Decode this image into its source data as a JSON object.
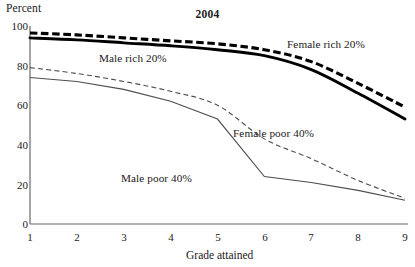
{
  "chart_data": {
    "type": "line",
    "title": "2004",
    "xlabel": "Grade attained",
    "ylabel": "Percent",
    "x": [
      1,
      2,
      3,
      4,
      5,
      6,
      7,
      8,
      9
    ],
    "xtick_labels": [
      "1",
      "2",
      "3",
      "4",
      "5",
      "6",
      "7",
      "8",
      "9"
    ],
    "ytick_labels": [
      "0",
      "20",
      "40",
      "60",
      "80",
      "100"
    ],
    "ytick_values": [
      0,
      20,
      40,
      60,
      80,
      100
    ],
    "ylim": [
      0,
      100
    ],
    "xlim": [
      1,
      9
    ],
    "grid": false,
    "legend_position": "inline-annotations",
    "series": [
      {
        "name": "Female rich 20%",
        "label": "Female rich 20%",
        "style": "thick-dashed",
        "color": "#000000",
        "values": [
          96.5,
          95.5,
          94,
          92.5,
          91,
          88,
          82,
          71,
          59
        ]
      },
      {
        "name": "Male rich 20%",
        "label": "Male rich 20%",
        "style": "thick-solid",
        "color": "#000000",
        "values": [
          94,
          93,
          91.5,
          90,
          88,
          85,
          78,
          66,
          53
        ]
      },
      {
        "name": "Female poor 40%",
        "label": "Female poor 40%",
        "style": "thin-dashed",
        "color": "#4d4d4d",
        "values": [
          79,
          76,
          72,
          67,
          60,
          43,
          33,
          22,
          13
        ]
      },
      {
        "name": "Male poor 40%",
        "label": "Male poor 40%",
        "style": "thin-solid",
        "color": "#4d4d4d",
        "values": [
          74,
          72,
          68,
          62,
          53,
          24,
          21,
          17,
          12
        ]
      }
    ]
  },
  "axes": {
    "y_title": "Percent",
    "x_title": "Grade attained"
  }
}
